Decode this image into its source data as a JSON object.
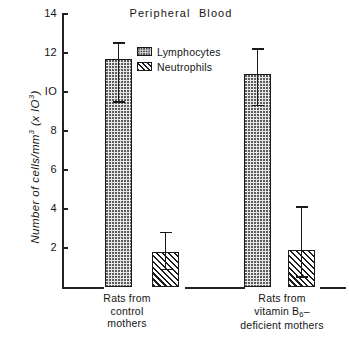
{
  "chart_data": {
    "type": "bar",
    "title": "Peripheral  Blood",
    "xlabel": "",
    "ylabel": "Number of cells/mm3 (x IO3)",
    "ylabel_parts": {
      "lead": "Number of cells/mm",
      "sup1": "3",
      "mid": " (x IO",
      "sup2": "3",
      "tail": ")"
    },
    "ylim": [
      0,
      14
    ],
    "yticks": [
      2,
      4,
      6,
      8,
      10,
      12,
      14
    ],
    "ytick_labels": [
      "2",
      "4",
      "6",
      "8",
      "IO",
      "12",
      "14"
    ],
    "grid": false,
    "legend_position": "upper-center",
    "categories": [
      "Rats from control mothers",
      "Rats from vitamin B6-deficient mothers"
    ],
    "category_lines": [
      [
        "Rats from",
        "control",
        "mothers"
      ],
      [
        "Rats from",
        "vitamin B6-",
        "deficient mothers"
      ]
    ],
    "series": [
      {
        "name": "Lymphocytes",
        "fill": "stipple",
        "values": [
          11.7,
          10.9
        ],
        "err_low": [
          9.5,
          9.3
        ],
        "err_high": [
          12.5,
          12.2
        ]
      },
      {
        "name": "Neutrophils",
        "fill": "diagonal-hatch",
        "values": [
          1.8,
          1.9
        ],
        "err_low": [
          0.9,
          0.5
        ],
        "err_high": [
          2.8,
          4.1
        ]
      }
    ]
  },
  "legend": {
    "items": [
      {
        "label": "Lymphocytes",
        "pattern": "stipple"
      },
      {
        "label": "Neutrophils",
        "pattern": "diagonal-hatch"
      }
    ]
  },
  "colors": {
    "ink": "#1a1a1a",
    "lymphocyte_fill": "#e7e7e7",
    "neutrophil_fill": "#f2f2f2",
    "background": "#ffffff"
  }
}
